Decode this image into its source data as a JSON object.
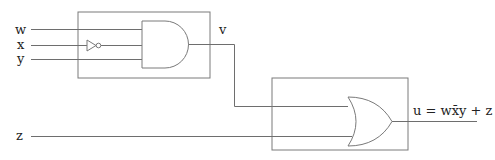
{
  "diagram": {
    "type": "logic-circuit",
    "inputs": [
      {
        "id": "w",
        "label": "w"
      },
      {
        "id": "x",
        "label": "x"
      },
      {
        "id": "y",
        "label": "y"
      },
      {
        "id": "z",
        "label": "z"
      }
    ],
    "blocks": [
      {
        "id": "block1",
        "contains": [
          "not-x",
          "and-gate"
        ]
      },
      {
        "id": "block2",
        "contains": [
          "or-gate"
        ]
      }
    ],
    "gates": [
      {
        "id": "not-x",
        "type": "NOT",
        "input": "x"
      },
      {
        "id": "and-gate",
        "type": "AND",
        "inputs": [
          "w",
          "not-x",
          "y"
        ],
        "output": "v"
      },
      {
        "id": "or-gate",
        "type": "OR",
        "inputs": [
          "v",
          "z"
        ],
        "output": "u"
      }
    ],
    "intermediate_label": "v",
    "output_label": "u = wx̄y + z"
  }
}
